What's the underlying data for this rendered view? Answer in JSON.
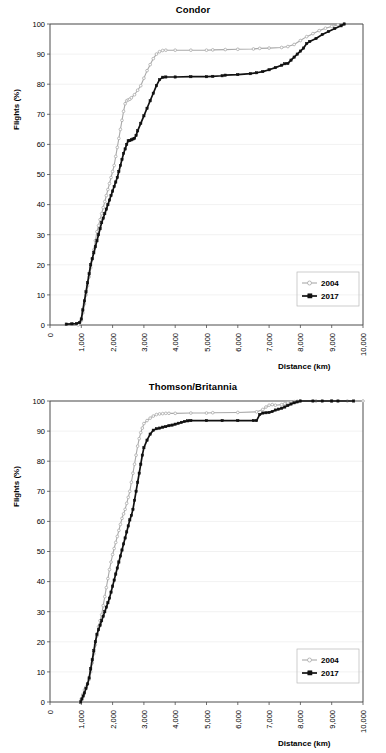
{
  "figure": {
    "axis_label_x": "Distance (km)",
    "axis_label_y": "Flights (%)",
    "colors": {
      "series_2004": "#a9a9a9",
      "series_2017": "#111111",
      "grid": "#e8e8e8",
      "axis": "#4d4d4d"
    }
  },
  "charts": [
    {
      "id": "condor",
      "title": "Condor",
      "legend": {
        "entry_a": "2004",
        "entry_b": "2017"
      }
    },
    {
      "id": "thomson-britannia",
      "title": "Thomson/Britannia",
      "legend": {
        "entry_a": "2004",
        "entry_b": "2017"
      }
    }
  ],
  "axes": {
    "y_ticks": [
      "0",
      "10",
      "20",
      "30",
      "40",
      "50",
      "60",
      "70",
      "80",
      "90",
      "100"
    ],
    "x_ticks": [
      "0",
      "1,000",
      "2,000",
      "3,000",
      "4,000",
      "5,000",
      "6,000",
      "7,000",
      "8,000",
      "9,000",
      "10,000"
    ]
  },
  "chart_data": [
    {
      "type": "line",
      "title": "Condor",
      "xlabel": "Distance (km)",
      "ylabel": "Flights (%)",
      "xlim": [
        0,
        10000
      ],
      "ylim": [
        0,
        100
      ],
      "xticks": [
        0,
        1000,
        2000,
        3000,
        4000,
        5000,
        6000,
        7000,
        8000,
        9000,
        10000
      ],
      "yticks": [
        0,
        10,
        20,
        30,
        40,
        50,
        60,
        70,
        80,
        90,
        100
      ],
      "grid": true,
      "legend_position": "lower-right",
      "series": [
        {
          "name": "2004",
          "marker": "open-circle",
          "color": "#a9a9a9",
          "x": [
            900,
            1000,
            1050,
            1100,
            1150,
            1200,
            1250,
            1300,
            1350,
            1400,
            1450,
            1500,
            1550,
            1600,
            1650,
            1700,
            1750,
            1800,
            1850,
            1900,
            1950,
            2000,
            2050,
            2100,
            2150,
            2200,
            2250,
            2300,
            2350,
            2400,
            2450,
            2500,
            2550,
            2600,
            2700,
            2800,
            2900,
            3000,
            3100,
            3200,
            3300,
            3400,
            3500,
            3600,
            3700,
            4000,
            4500,
            5000,
            5200,
            5600,
            6000,
            6500,
            6700,
            7000,
            7400,
            7600,
            7800,
            8000,
            8200,
            8400,
            8600,
            8800,
            9000,
            9200,
            9400
          ],
          "y": [
            0,
            1.5,
            4,
            7,
            10,
            13,
            16,
            19,
            22,
            25,
            28,
            31,
            33,
            35,
            37,
            39,
            41,
            43,
            45,
            47,
            49,
            51,
            53,
            56,
            59,
            62,
            65,
            68,
            71,
            73.5,
            74.5,
            74.8,
            75,
            75.5,
            76.5,
            78,
            79.5,
            82,
            84.5,
            86.5,
            88.5,
            90,
            90.8,
            91.2,
            91.3,
            91.3,
            91.3,
            91.3,
            91.4,
            91.5,
            91.6,
            91.7,
            91.9,
            92.0,
            92.2,
            92.5,
            93.2,
            94.5,
            95.8,
            96.8,
            97.8,
            98.6,
            99.2,
            99.7,
            100
          ]
        },
        {
          "name": "2017",
          "marker": "filled-square",
          "color": "#111111",
          "x": [
            520,
            700,
            850,
            950,
            1000,
            1050,
            1100,
            1150,
            1200,
            1250,
            1300,
            1350,
            1400,
            1450,
            1500,
            1550,
            1600,
            1650,
            1700,
            1750,
            1800,
            1850,
            1900,
            1950,
            2000,
            2050,
            2100,
            2150,
            2200,
            2250,
            2300,
            2350,
            2400,
            2450,
            2500,
            2550,
            2600,
            2650,
            2700,
            2750,
            2800,
            2900,
            3000,
            3100,
            3200,
            3300,
            3400,
            3500,
            3600,
            3700,
            4000,
            4500,
            5000,
            5200,
            5500,
            5600,
            6000,
            6400,
            6600,
            6800,
            7000,
            7200,
            7400,
            7500,
            7600,
            7700,
            7800,
            7900,
            8000,
            8100,
            8200,
            8300,
            8500,
            8700,
            8900,
            9100,
            9300,
            9400
          ],
          "y": [
            0.3,
            0.4,
            0.5,
            0.8,
            2,
            5,
            8,
            11,
            14,
            17,
            20,
            22,
            24,
            26,
            28,
            30,
            32,
            34,
            35.5,
            37,
            38.5,
            40,
            41.5,
            43,
            44.5,
            46,
            47.5,
            49,
            51,
            53,
            55,
            57,
            58.5,
            60,
            61.2,
            61.3,
            61.5,
            61.8,
            62,
            63,
            64.5,
            67,
            69.5,
            72,
            74.5,
            77,
            79.5,
            81.5,
            82.3,
            82.4,
            82.4,
            82.5,
            82.5,
            82.6,
            82.8,
            83.0,
            83.2,
            83.5,
            83.8,
            84.2,
            84.8,
            85.5,
            86.3,
            86.8,
            86.9,
            88,
            89,
            90,
            91,
            92,
            93.5,
            94.2,
            95.2,
            96.5,
            97.5,
            98.5,
            99.4,
            100
          ]
        }
      ]
    },
    {
      "type": "line",
      "title": "Thomson/Britannia",
      "xlabel": "Distance (km)",
      "ylabel": "Flights (%)",
      "xlim": [
        0,
        10000
      ],
      "ylim": [
        0,
        100
      ],
      "xticks": [
        0,
        1000,
        2000,
        3000,
        4000,
        5000,
        6000,
        7000,
        8000,
        9000,
        10000
      ],
      "yticks": [
        0,
        10,
        20,
        30,
        40,
        50,
        60,
        70,
        80,
        90,
        100
      ],
      "grid": true,
      "legend_position": "lower-right",
      "series": [
        {
          "name": "2004",
          "marker": "open-circle",
          "color": "#a9a9a9",
          "x": [
            950,
            1000,
            1050,
            1100,
            1150,
            1200,
            1250,
            1300,
            1350,
            1400,
            1450,
            1500,
            1550,
            1600,
            1650,
            1700,
            1750,
            1800,
            1850,
            1900,
            1950,
            2000,
            2050,
            2100,
            2150,
            2200,
            2250,
            2300,
            2350,
            2400,
            2450,
            2500,
            2550,
            2600,
            2650,
            2700,
            2750,
            2800,
            2850,
            2900,
            2950,
            3000,
            3100,
            3200,
            3300,
            3400,
            3500,
            3600,
            3700,
            3800,
            4000,
            4500,
            5000,
            5200,
            6000,
            6600,
            6800,
            6900,
            7000,
            7100,
            7200,
            7400,
            7500,
            7600,
            7700,
            7800,
            7900,
            8000,
            8500,
            9000,
            9500,
            10000
          ],
          "y": [
            0,
            1,
            2.5,
            4,
            5,
            6,
            7.5,
            10,
            13,
            16,
            19,
            22,
            25,
            27,
            29,
            32,
            35,
            38,
            41,
            44,
            46.5,
            49,
            51,
            53,
            55,
            57,
            59,
            61,
            62.5,
            64,
            66,
            68,
            70,
            73,
            76,
            79,
            82,
            85,
            87.5,
            89.5,
            91,
            92.5,
            93.5,
            94.3,
            95,
            95.5,
            95.7,
            95.8,
            95.9,
            95.9,
            95.9,
            96,
            96,
            96.1,
            96.2,
            96.4,
            97.2,
            98,
            98.6,
            98.8,
            98.6,
            98.8,
            99.1,
            99.4,
            99.6,
            99.8,
            99.9,
            100,
            100,
            100,
            100,
            100
          ]
        },
        {
          "name": "2017",
          "marker": "filled-square",
          "color": "#111111",
          "x": [
            980,
            1020,
            1060,
            1100,
            1150,
            1200,
            1250,
            1300,
            1350,
            1400,
            1450,
            1500,
            1550,
            1600,
            1650,
            1700,
            1750,
            1800,
            1850,
            1900,
            1950,
            2000,
            2050,
            2100,
            2150,
            2200,
            2250,
            2300,
            2350,
            2400,
            2450,
            2500,
            2550,
            2600,
            2650,
            2700,
            2750,
            2800,
            2850,
            2900,
            2950,
            3000,
            3100,
            3200,
            3300,
            3400,
            3500,
            3600,
            3700,
            3800,
            3900,
            4000,
            4100,
            4200,
            4300,
            4400,
            4500,
            5000,
            5500,
            6000,
            6500,
            6600,
            6700,
            6800,
            6900,
            7000,
            7100,
            7200,
            7300,
            7400,
            7500,
            7600,
            7700,
            7800,
            7900,
            8000,
            8400,
            8700,
            9000,
            9200,
            9700
          ],
          "y": [
            0,
            1,
            2,
            3,
            4.5,
            6,
            8,
            11,
            14,
            17,
            20,
            22.5,
            24,
            25.5,
            27,
            28.5,
            30,
            31.5,
            33,
            34.5,
            36.5,
            38.5,
            40.5,
            42.5,
            44.5,
            46.5,
            48.5,
            50.5,
            52.5,
            54.5,
            56.5,
            58.5,
            60.5,
            62,
            64,
            67,
            70,
            73,
            76,
            79,
            82,
            84.5,
            87,
            89,
            90.3,
            90.8,
            91,
            91.3,
            91.5,
            91.8,
            92,
            92.3,
            92.6,
            92.9,
            93.2,
            93.4,
            93.5,
            93.5,
            93.5,
            93.5,
            93.5,
            93.5,
            95.5,
            96,
            96.1,
            96.2,
            96.5,
            97,
            97.3,
            97.6,
            98,
            98.5,
            99,
            99.4,
            99.7,
            100,
            100,
            100,
            100,
            100,
            100
          ]
        }
      ]
    }
  ]
}
